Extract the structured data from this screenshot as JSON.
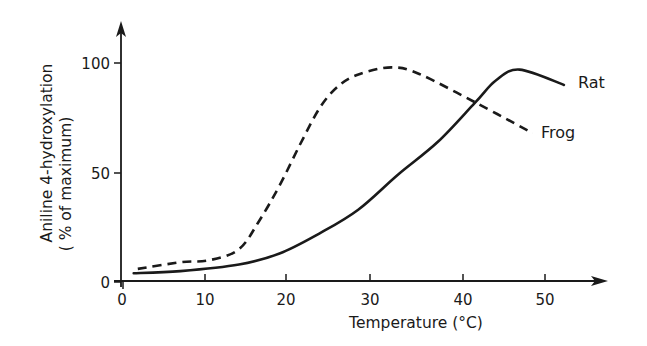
{
  "chart_data": {
    "type": "line",
    "title": "",
    "xlabel": "Temperature (°C)",
    "ylabel": "Aniline 4-hydroxylation",
    "ylabel_line2": "( % of maximum)",
    "xlim": [
      0,
      55
    ],
    "ylim": [
      0,
      110
    ],
    "x_ticks": [
      0,
      10,
      20,
      30,
      40,
      50
    ],
    "x_tick_labels": [
      "0",
      "10",
      "20",
      "30",
      "40",
      "50"
    ],
    "y_ticks": [
      0,
      50,
      100
    ],
    "y_tick_labels": [
      "0",
      "50",
      "100"
    ],
    "grid": false,
    "legend": "inline labels at curve ends",
    "series": [
      {
        "name": "Rat",
        "style": "solid",
        "x": [
          1.3,
          7,
          14.2,
          19.2,
          23.9,
          28.6,
          33,
          37.3,
          41.5,
          44,
          46.9,
          52.3
        ],
        "values": [
          4,
          5,
          8,
          13,
          22,
          33,
          49,
          64,
          82,
          92,
          97,
          90
        ]
      },
      {
        "name": "Frog",
        "style": "dashed",
        "x": [
          1.8,
          7,
          10.6,
          14.2,
          16.7,
          19.2,
          21.7,
          24.1,
          26.4,
          28.8,
          32.3,
          35.3,
          41.5,
          48.5
        ],
        "values": [
          6,
          9,
          10,
          15,
          28,
          44,
          63,
          80,
          90,
          95,
          98,
          95,
          82,
          68
        ]
      }
    ],
    "annotations": [
      "Rat",
      "Frog"
    ]
  },
  "labels": {
    "y_title_line1": "Aniline 4-hydroxylation",
    "y_title_line2": "( % of maximum)",
    "x_title": "Temperature  (°C)",
    "rat": "Rat",
    "frog": "Frog",
    "xt0": "0",
    "xt1": "10",
    "xt2": "20",
    "xt3": "30",
    "xt4": "40",
    "xt5": "50",
    "yt0": "0",
    "yt1": "50",
    "yt2": "100"
  },
  "colors": {
    "ink": "#1a1a1a",
    "background": "#ffffff"
  }
}
